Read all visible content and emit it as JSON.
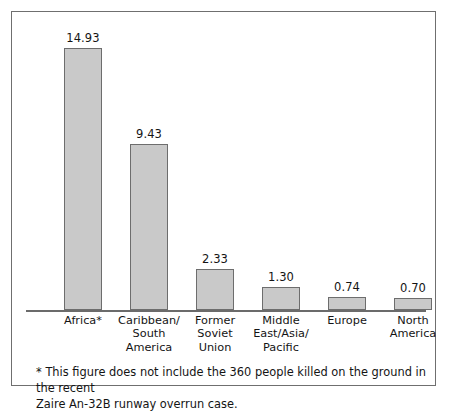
{
  "figure": {
    "frame_color": "#6f6f6f",
    "background": "#ffffff",
    "bar_fill": "#c9c9c9",
    "bar_stroke": "#6d6d6d",
    "axis_color": "#6b6b6b"
  },
  "footnote": {
    "line1": "* This figure does not include the 360 people killed on the ground in the recent",
    "line2": "Zaire An-32B runway overrun case."
  },
  "categories_multiline": [
    [
      "Africa*"
    ],
    [
      "Caribbean/",
      "South",
      "America"
    ],
    [
      "Former",
      "Soviet",
      "Union"
    ],
    [
      "Middle",
      "East/Asia/",
      "Pacific"
    ],
    [
      "Europe"
    ],
    [
      "North",
      "America"
    ]
  ],
  "chart_data": {
    "type": "bar",
    "title": "",
    "subtitle": "",
    "xlabel": "",
    "ylabel": "",
    "grid": false,
    "legend": false,
    "axis": {
      "x_axis_visible": true,
      "y_axis_visible": false,
      "ylim": [
        0,
        16.5
      ]
    },
    "categories": [
      "Africa*",
      "Caribbean/South America",
      "Former Soviet Union",
      "Middle East/Asia/Pacific",
      "Europe",
      "North America"
    ],
    "values": [
      14.93,
      9.43,
      2.33,
      1.3,
      0.74,
      0.7
    ],
    "value_labels": [
      "14.93",
      "9.43",
      "2.33",
      "1.30",
      "0.74",
      "0.70"
    ],
    "annotations": [
      "* This figure does not include the 360 people killed on the ground in the recent Zaire An-32B runway overrun case."
    ]
  }
}
